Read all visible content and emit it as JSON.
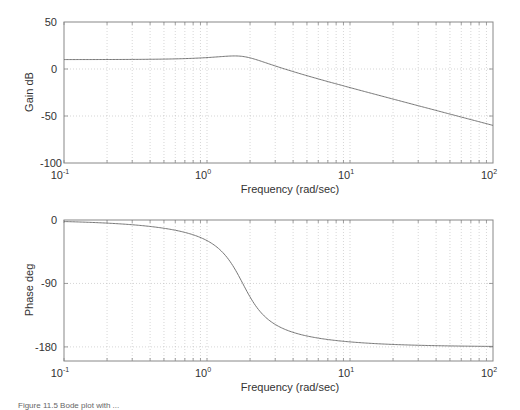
{
  "chart_data": [
    {
      "type": "line",
      "title": "",
      "xlabel": "Frequency (rad/sec)",
      "ylabel": "Gain dB",
      "xscale": "log",
      "xlim": [
        0.1,
        100
      ],
      "ylim": [
        -100,
        50
      ],
      "xticks": [
        "10^-1",
        "10^0",
        "10^1",
        "10^2"
      ],
      "yticks": [
        50,
        0,
        -50,
        -100
      ],
      "grid": true,
      "series": [
        {
          "name": "gain",
          "x": [
            0.1,
            0.2,
            0.5,
            0.8,
            1.0,
            1.3,
            1.6,
            1.75,
            2.0,
            2.5,
            3.0,
            5.0,
            10.0,
            20.0,
            50.0,
            100.0
          ],
          "values": [
            10.0,
            10.1,
            10.6,
            11.7,
            12.6,
            14.0,
            14.6,
            14.2,
            11.8,
            6.2,
            2.0,
            -7.6,
            -19.6,
            -32.0,
            -48.0,
            -60.0
          ]
        }
      ]
    },
    {
      "type": "line",
      "title": "",
      "xlabel": "Frequency (rad/sec)",
      "ylabel": "Phase deg",
      "xscale": "log",
      "xlim": [
        0.1,
        100
      ],
      "ylim": [
        -200,
        0
      ],
      "xticks": [
        "10^-1",
        "10^0",
        "10^1",
        "10^2"
      ],
      "yticks": [
        0,
        -90,
        -180
      ],
      "grid": true,
      "series": [
        {
          "name": "phase",
          "x": [
            0.1,
            0.2,
            0.5,
            0.8,
            1.0,
            1.3,
            1.6,
            1.75,
            2.0,
            2.5,
            3.0,
            5.0,
            10.0,
            20.0,
            50.0,
            100.0
          ],
          "values": [
            -2.2,
            -4.5,
            -12.0,
            -22.0,
            -31.0,
            -52.0,
            -78.0,
            -90.0,
            -110.0,
            -135.0,
            -148.0,
            -164.0,
            -172.0,
            -176.0,
            -178.5,
            -179.3
          ]
        }
      ]
    }
  ],
  "model": {
    "K": 10,
    "wn2": 3.16,
    "zeta": 0.34
  },
  "labels": {
    "gain_ylabel": "Gain dB",
    "phase_ylabel": "Phase deg",
    "xlabel": "Frequency (rad/sec)",
    "gain_yticks": [
      "50",
      "0",
      "-50",
      "-100"
    ],
    "phase_yticks": [
      "0",
      "-90",
      "-180"
    ],
    "x_base": "10",
    "x_exps": [
      "-1",
      "0",
      "1",
      "2"
    ]
  },
  "caption": "Figure 11.5 Bode plot with ..."
}
